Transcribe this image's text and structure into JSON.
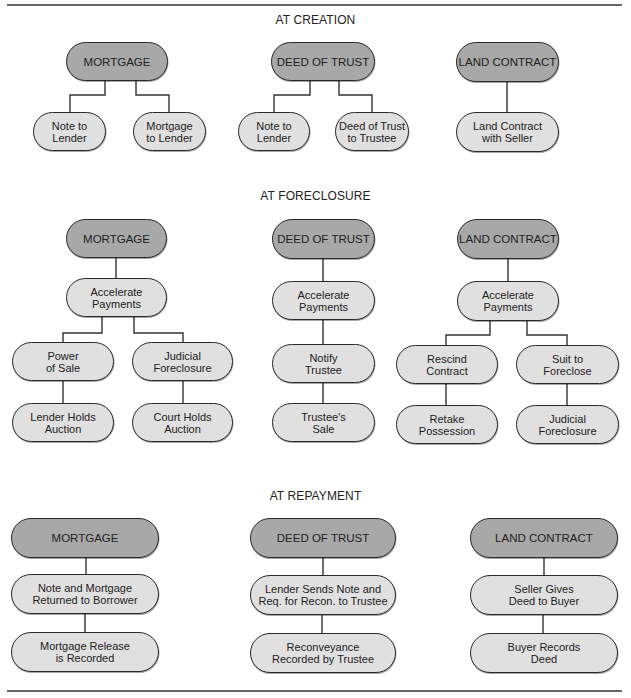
{
  "diagram": {
    "colors": {
      "head_fill": "#a8a8a8",
      "child_fill": "#e0e0e0",
      "stroke": "#2a2a2a"
    },
    "sections": [
      {
        "title": "AT CREATION",
        "columns": [
          {
            "head": "MORTGAGE",
            "children": [
              "Note to\nLender",
              "Mortgage\nto Lender"
            ]
          },
          {
            "head": "DEED OF TRUST",
            "children": [
              "Note to\nLender",
              "Deed of Trust\nto Trustee"
            ]
          },
          {
            "head": "LAND CONTRACT",
            "children": [
              "Land Contract\nwith Seller"
            ]
          }
        ]
      },
      {
        "title": "AT FORECLOSURE",
        "columns": [
          {
            "head": "MORTGAGE",
            "step": "Accelerate\nPayments",
            "branches": [
              {
                "first": "Power\nof Sale",
                "second": "Lender Holds\nAuction"
              },
              {
                "first": "Judicial\nForeclosure",
                "second": "Court Holds\nAuction"
              }
            ]
          },
          {
            "head": "DEED OF TRUST",
            "steps": [
              "Accelerate\nPayments",
              "Notify\nTrustee",
              "Trustee's\nSale"
            ]
          },
          {
            "head": "LAND CONTRACT",
            "step": "Accelerate\nPayments",
            "branches": [
              {
                "first": "Rescind\nContract",
                "second": "Retake\nPossession"
              },
              {
                "first": "Suit to\nForeclose",
                "second": "Judicial\nForeclosure"
              }
            ]
          }
        ]
      },
      {
        "title": "AT REPAYMENT",
        "columns": [
          {
            "head": "MORTGAGE",
            "steps": [
              "Note and Mortgage\nReturned to Borrower",
              "Mortgage Release\nis Recorded"
            ]
          },
          {
            "head": "DEED OF TRUST",
            "steps": [
              "Lender Sends Note and\nReq. for Recon. to Trustee",
              "Reconveyance\nRecorded by Trustee"
            ]
          },
          {
            "head": "LAND CONTRACT",
            "steps": [
              "Seller Gives\nDeed to Buyer",
              "Buyer Records\nDeed"
            ]
          }
        ]
      }
    ]
  }
}
